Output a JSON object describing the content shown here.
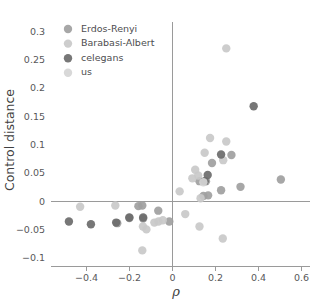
{
  "chart_data": {
    "type": "scatter",
    "title": "",
    "xlabel": "ρ",
    "ylabel": "Control distance",
    "xlim": [
      -0.56,
      0.64
    ],
    "ylim": [
      -0.115,
      0.315
    ],
    "xticks": [
      -0.4,
      -0.2,
      0,
      0.2,
      0.4,
      0.6
    ],
    "xticklabels": [
      "−0.4",
      "−0.2",
      "0",
      "0.2",
      "0.4",
      "0.6"
    ],
    "yticks": [
      -0.1,
      -0.05,
      0,
      0.05,
      0.1,
      0.15,
      0.2,
      0.25,
      0.3
    ],
    "yticklabels": [
      "−0.1",
      "−0.05",
      "0",
      "0.05",
      "0.1",
      "0.15",
      "0.2",
      "0.25",
      "0.3"
    ],
    "grid": false,
    "zero_lines": {
      "x": 0,
      "y": 0
    },
    "legend_position": "upper-left",
    "marker_radius": 4.2,
    "series": [
      {
        "name": "Erdos-Renyi",
        "color": "#a0a0a0",
        "points": [
          [
            -0.253,
            -0.0395
          ],
          [
            -0.197,
            -0.0305
          ],
          [
            -0.137,
            -0.0085
          ],
          [
            -0.133,
            -0.0315
          ],
          [
            -0.063,
            -0.0175
          ],
          [
            -0.155,
            -0.0095
          ],
          [
            0.128,
            0.0345
          ],
          [
            0.158,
            0.0345
          ],
          [
            0.168,
            0.0095
          ],
          [
            0.146,
            0.0085
          ],
          [
            0.228,
            0.0185
          ],
          [
            0.276,
            0.0805
          ],
          [
            0.318,
            0.0245
          ],
          [
            0.505,
            0.0375
          ],
          [
            0.186,
            0.0665
          ],
          [
            -0.012,
            -0.0365
          ]
        ]
      },
      {
        "name": "Barabasi-Albert",
        "color": "#c9c9c9",
        "points": [
          [
            -0.425,
            -0.0105
          ],
          [
            -0.262,
            -0.0085
          ],
          [
            -0.134,
            -0.0455
          ],
          [
            -0.118,
            -0.0505
          ],
          [
            -0.081,
            -0.0385
          ],
          [
            -0.062,
            -0.0365
          ],
          [
            -0.042,
            -0.0345
          ],
          [
            0.036,
            0.0165
          ],
          [
            0.095,
            0.0395
          ],
          [
            0.122,
            0.0445
          ],
          [
            0.108,
            0.0545
          ],
          [
            0.177,
            0.1105
          ],
          [
            0.252,
            0.1045
          ],
          [
            0.238,
            0.0715
          ],
          [
            0.152,
            0.0845
          ],
          [
            0.133,
            0.0045
          ],
          [
            0.062,
            -0.0235
          ],
          [
            0.128,
            -0.0455
          ],
          [
            0.236,
            -0.0665
          ],
          [
            -0.137,
            -0.0875
          ],
          [
            0.252,
            0.2685
          ]
        ]
      },
      {
        "name": "celegans",
        "color": "#6b6b6b",
        "points": [
          [
            -0.477,
            -0.0365
          ],
          [
            -0.375,
            -0.0415
          ],
          [
            -0.258,
            -0.0385
          ],
          [
            -0.197,
            -0.0295
          ],
          [
            -0.133,
            -0.0295
          ],
          [
            0.152,
            0.0345
          ],
          [
            0.166,
            0.0455
          ],
          [
            0.228,
            0.0815
          ],
          [
            0.379,
            0.1665
          ]
        ]
      },
      {
        "name": "us",
        "color": "#d5d5d5",
        "points": [
          [
            0.146,
            0.0325
          ]
        ]
      }
    ]
  },
  "legend": {
    "entries": [
      {
        "label": "Erdos-Renyi",
        "color": "#a0a0a0"
      },
      {
        "label": "Barabasi-Albert",
        "color": "#c9c9c9"
      },
      {
        "label": "celegans",
        "color": "#6b6b6b"
      },
      {
        "label": "us",
        "color": "#d5d5d5"
      }
    ]
  },
  "axes": {
    "x_title": "ρ",
    "y_title": "Control distance"
  }
}
